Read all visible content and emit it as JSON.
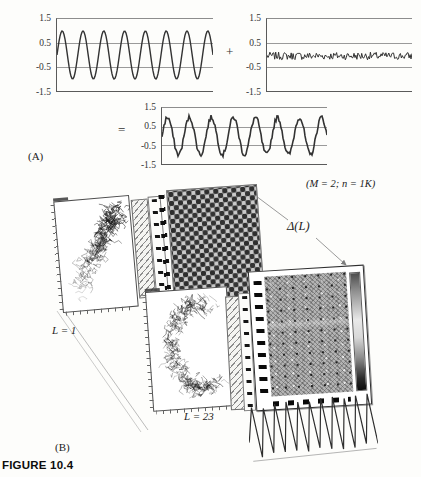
{
  "figure": {
    "caption": "FIGURE 10.4",
    "panel_a_label": "(A)",
    "panel_b_label": "(B)",
    "params_label": "(M = 2; n = 1K)",
    "delta_label": "Δ(L)",
    "l1_label": "L = 1",
    "l23_label": "L = 23",
    "plus_sign": "+",
    "equals_sign": "=",
    "yticks": [
      "1.5",
      "0.5",
      "-0.5",
      "-1.5"
    ]
  },
  "chart_data": [
    {
      "type": "line",
      "id": "clean_sine",
      "role": "panel-a-left",
      "title": "",
      "ylim": [
        -1.5,
        1.5
      ],
      "yticks": [
        1.5,
        0.5,
        -0.5,
        -1.5
      ],
      "gridlines": [
        0.5,
        -0.5
      ],
      "amplitude": 1.0,
      "cycles": 7.5,
      "noise": 0,
      "mean": 0
    },
    {
      "type": "line",
      "id": "noise",
      "role": "panel-a-right",
      "title": "",
      "ylim": [
        -1.5,
        1.5
      ],
      "yticks": [
        1.5,
        0.5,
        -0.5,
        -1.5
      ],
      "gridlines": [
        0.5,
        -0.5
      ],
      "amplitude": 0,
      "cycles": 0,
      "noise": 0.16,
      "mean": -0.04
    },
    {
      "type": "line",
      "id": "noisy_sine",
      "role": "panel-a-result",
      "title": "",
      "ylim": [
        -1.5,
        1.5
      ],
      "yticks": [
        1.5,
        0.5,
        -0.5,
        -1.5
      ],
      "gridlines": [
        0.5,
        -0.5
      ],
      "amplitude": 1.0,
      "cycles": 7.5,
      "noise": 0.13,
      "mean": 0
    },
    {
      "type": "scatter",
      "id": "phase_portrait_L1",
      "label": "L = 1",
      "shape": "diagonal-cloud",
      "points": 260
    },
    {
      "type": "scatter",
      "id": "phase_portrait_L23",
      "label": "L = 23",
      "shape": "crescent-cloud",
      "points": 260
    },
    {
      "type": "heatmap",
      "id": "delta_matrix_small",
      "label": "Δ(L)",
      "pattern": "checkerboard"
    },
    {
      "type": "heatmap",
      "id": "delta_matrix_large",
      "label": "Δ(L)",
      "pattern": "dense-grain",
      "colorbar": true
    },
    {
      "type": "line",
      "id": "triangle_wave",
      "role": "panel-b-bottom",
      "cycles": 11,
      "amplitude": 1
    }
  ]
}
